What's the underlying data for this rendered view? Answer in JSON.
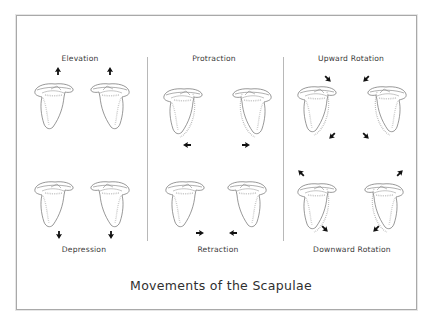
{
  "figure": {
    "title": "Movements of the Scapulae",
    "colors": {
      "frame": "#a9a9a9",
      "divider": "#b8b8b8",
      "outline": "#6b6b6b",
      "shading": "#b5b5b5",
      "arrow": "#111111",
      "text": "#333333"
    },
    "panels": [
      {
        "column": 1,
        "top_label": "Elevation",
        "bottom_label": "Depression",
        "top_arrows": [
          "up",
          "up"
        ],
        "bottom_arrows": [
          "down",
          "down"
        ]
      },
      {
        "column": 2,
        "top_label": "Protraction",
        "bottom_label": "Retraction",
        "top_arrows": [
          "left",
          "right"
        ],
        "bottom_arrows": [
          "right",
          "left"
        ]
      },
      {
        "column": 3,
        "top_label": "Upward Rotation",
        "bottom_label": "Downward Rotation",
        "top_arrows": [
          "down-left",
          "down-left",
          "down-right",
          "down-right"
        ],
        "bottom_arrows": [
          "up-left",
          "down-right",
          "up-right",
          "down-left"
        ]
      }
    ]
  }
}
